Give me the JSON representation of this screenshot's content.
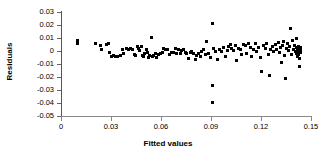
{
  "chart_data": {
    "type": "scatter",
    "title": "",
    "xlabel": "Fitted values",
    "ylabel": "Residuals",
    "xlim": [
      0,
      0.15
    ],
    "ylim": [
      -0.05,
      0.03
    ],
    "xticks": [
      "0",
      "0.03",
      "0.06",
      "0.09",
      "0.12",
      "0.15"
    ],
    "xtick_values": [
      0,
      0.03,
      0.06,
      0.09,
      0.12,
      0.15
    ],
    "yticks": [
      "0.03",
      "0.02",
      "0.01",
      "0",
      "-0.01",
      "-0.02",
      "-0.03",
      "-0.04",
      "-0.05"
    ],
    "ytick_values": [
      0.03,
      0.02,
      0.01,
      0,
      -0.01,
      -0.02,
      -0.03,
      -0.04,
      -0.05
    ],
    "grid": false,
    "legend": null,
    "marker": "square",
    "marker_color": "#000000",
    "series": [
      {
        "name": "Residuals",
        "points": [
          [
            0.0101,
            0.0072
          ],
          [
            0.0101,
            0.0058
          ],
          [
            0.0205,
            0.0058
          ],
          [
            0.0235,
            0.0041
          ],
          [
            0.0241,
            0.0012
          ],
          [
            0.0271,
            0.005
          ],
          [
            0.0283,
            0.0054
          ],
          [
            0.0289,
            -0.0012
          ],
          [
            0.0301,
            -0.0042
          ],
          [
            0.0313,
            -0.0038
          ],
          [
            0.0325,
            -0.0042
          ],
          [
            0.0337,
            -0.0042
          ],
          [
            0.0355,
            -0.0038
          ],
          [
            0.0367,
            0.0012
          ],
          [
            0.0373,
            -0.002
          ],
          [
            0.0391,
            0.0016
          ],
          [
            0.0403,
            0.001
          ],
          [
            0.0415,
            0.0022
          ],
          [
            0.0427,
            0.0008
          ],
          [
            0.0439,
            -0.0026
          ],
          [
            0.0445,
            -0.0038
          ],
          [
            0.0457,
            0.0035
          ],
          [
            0.0463,
            0.0018
          ],
          [
            0.0469,
            0.0002
          ],
          [
            0.0481,
            0.0038
          ],
          [
            0.0487,
            -0.0032
          ],
          [
            0.0493,
            -0.0045
          ],
          [
            0.0499,
            -0.002
          ],
          [
            0.0511,
            0.0008
          ],
          [
            0.0517,
            -0.001
          ],
          [
            0.0523,
            -0.005
          ],
          [
            0.0529,
            -0.0038
          ],
          [
            0.0541,
            0.0106
          ],
          [
            0.0547,
            -0.0042
          ],
          [
            0.0553,
            -0.0038
          ],
          [
            0.0565,
            -0.002
          ],
          [
            0.0571,
            -0.0052
          ],
          [
            0.0583,
            -0.003
          ],
          [
            0.0595,
            -0.0018
          ],
          [
            0.0607,
            -0.0008
          ],
          [
            0.0613,
            0.0018
          ],
          [
            0.0625,
            0.0014
          ],
          [
            0.0637,
            0.0008
          ],
          [
            0.0649,
            -0.0028
          ],
          [
            0.0661,
            -0.0012
          ],
          [
            0.0673,
            -0.001
          ],
          [
            0.0685,
            0.0022
          ],
          [
            0.0691,
            -0.0018
          ],
          [
            0.0703,
            0.0008
          ],
          [
            0.0715,
            -0.0018
          ],
          [
            0.0721,
            0.0002
          ],
          [
            0.0733,
            0.0012
          ],
          [
            0.0745,
            -0.0012
          ],
          [
            0.0751,
            -0.002
          ],
          [
            0.0763,
            -0.0058
          ],
          [
            0.0775,
            -0.001
          ],
          [
            0.0781,
            0.0
          ],
          [
            0.0793,
            -0.0022
          ],
          [
            0.0805,
            -0.0068
          ],
          [
            0.0811,
            -0.0032
          ],
          [
            0.0823,
            -0.0022
          ],
          [
            0.0835,
            -0.004
          ],
          [
            0.0841,
            0.0
          ],
          [
            0.0853,
            0.001
          ],
          [
            0.0865,
            -0.0026
          ],
          [
            0.0871,
            0.0074
          ],
          [
            0.0883,
            -0.0016
          ],
          [
            0.0895,
            -0.0048
          ],
          [
            0.0906,
            0.0215
          ],
          [
            0.0906,
            -0.0268
          ],
          [
            0.0906,
            -0.0395
          ],
          [
            0.0913,
            0.002
          ],
          [
            0.0925,
            -0.0004
          ],
          [
            0.0937,
            -0.0062
          ],
          [
            0.0949,
            0.0014
          ],
          [
            0.0961,
            -0.0006
          ],
          [
            0.0973,
            0.0028
          ],
          [
            0.0985,
            -0.0042
          ],
          [
            0.0997,
            0.0004
          ],
          [
            0.1003,
            0.0036
          ],
          [
            0.1015,
            0.0048
          ],
          [
            0.1021,
            0.0016
          ],
          [
            0.1033,
            0.0002
          ],
          [
            0.1045,
            0.0046
          ],
          [
            0.1051,
            -0.0072
          ],
          [
            0.1063,
            0.002
          ],
          [
            0.1075,
            0.001
          ],
          [
            0.1081,
            -0.0028
          ],
          [
            0.1093,
            0.0052
          ],
          [
            0.1105,
            0.004
          ],
          [
            0.1111,
            -0.0018
          ],
          [
            0.1123,
            0.0058
          ],
          [
            0.1135,
            0.0026
          ],
          [
            0.1141,
            -0.004
          ],
          [
            0.1153,
            0.0012
          ],
          [
            0.1165,
            0.0054
          ],
          [
            0.1171,
            0.0
          ],
          [
            0.1183,
            0.003
          ],
          [
            0.1195,
            -0.0048
          ],
          [
            0.1201,
            -0.016
          ],
          [
            0.1213,
            0.0044
          ],
          [
            0.1225,
            0.0016
          ],
          [
            0.1231,
            0.0058
          ],
          [
            0.1243,
            -0.003
          ],
          [
            0.1249,
            -0.0188
          ],
          [
            0.1255,
            0.001
          ],
          [
            0.1267,
            0.0038
          ],
          [
            0.1273,
            0.0
          ],
          [
            0.1285,
            0.005
          ],
          [
            0.1291,
            0.0014
          ],
          [
            0.1303,
            0.0062
          ],
          [
            0.1309,
            -0.001
          ],
          [
            0.1315,
            0.003
          ],
          [
            0.1321,
            -0.009
          ],
          [
            0.1327,
            0.0046
          ],
          [
            0.1333,
            0.0074
          ],
          [
            0.1339,
            -0.0032
          ],
          [
            0.1345,
            -0.0212
          ],
          [
            0.1351,
            0.002
          ],
          [
            0.1357,
            0.0058
          ],
          [
            0.1363,
            0.0002
          ],
          [
            0.1369,
            0.0038
          ],
          [
            0.1375,
            0.017
          ],
          [
            0.1381,
            -0.0026
          ],
          [
            0.1387,
            0.008
          ],
          [
            0.1393,
            0.0014
          ],
          [
            0.1399,
            0.0046
          ],
          [
            0.1405,
            -0.0006
          ],
          [
            0.1411,
            0.01
          ],
          [
            0.1413,
            0.0028
          ],
          [
            0.1415,
            -0.0016
          ],
          [
            0.1417,
            0.0008
          ],
          [
            0.1419,
            -0.004
          ],
          [
            0.1421,
            0.0018
          ],
          [
            0.1423,
            -0.0002
          ],
          [
            0.1425,
            0.0036
          ],
          [
            0.1427,
            -0.0028
          ],
          [
            0.1429,
            0.0012
          ],
          [
            0.1431,
            -0.012
          ],
          [
            0.1433,
            -0.0058
          ],
          [
            0.1435,
            0.0024
          ],
          [
            0.1437,
            -0.0008
          ],
          [
            0.1439,
            0.0004
          ]
        ]
      }
    ]
  }
}
